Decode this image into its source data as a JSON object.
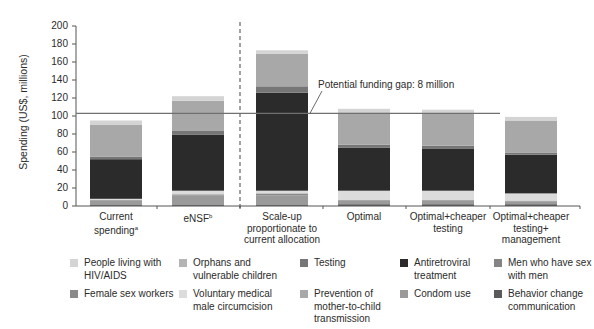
{
  "chart_data": {
    "type": "bar",
    "stacked": true,
    "title": "",
    "xlabel": "",
    "ylabel": "Spending (US$, millions)",
    "ylim": [
      0,
      200
    ],
    "yticks": [
      0,
      20,
      40,
      60,
      80,
      100,
      120,
      140,
      160,
      180,
      200
    ],
    "grid": false,
    "legend_position": "bottom",
    "categories": [
      "Current spending",
      "eNSF",
      "Scale-up proportionate to current allocation",
      "Optimal",
      "Optimal+cheaper testing",
      "Optimal+cheaper testing+ management"
    ],
    "category_superscripts": [
      "a",
      "b",
      "",
      "",
      "",
      ""
    ],
    "series": [
      {
        "name": "Behavior change communication",
        "color": "#5a5a5a",
        "values": [
          1,
          1,
          1,
          2,
          2,
          2
        ]
      },
      {
        "name": "Condom use",
        "color": "#9a9a9a",
        "values": [
          5,
          11,
          11,
          4,
          4,
          3
        ]
      },
      {
        "name": "Female sex workers",
        "color": "#8a8a8a",
        "values": [
          1,
          1,
          2,
          1,
          1,
          1
        ]
      },
      {
        "name": "Voluntary medical male circumcision",
        "color": "#dcdcdc",
        "values": [
          1,
          4,
          3,
          10,
          10,
          8
        ]
      },
      {
        "name": "Antiretroviral treatment",
        "color": "#2b2b2b",
        "values": [
          44,
          62,
          109,
          48,
          47,
          43
        ]
      },
      {
        "name": "Testing",
        "color": "#767676",
        "values": [
          3,
          5,
          7,
          3,
          3,
          2
        ]
      },
      {
        "name": "Prevention of mother-to-child transmission",
        "color": "#a8a8a8",
        "values": [
          35,
          33,
          36,
          36,
          36,
          36
        ]
      },
      {
        "name": "People living with HIV/AIDS",
        "color": "#d4d4d4",
        "values": [
          5,
          5,
          4,
          4,
          4,
          4
        ]
      },
      {
        "name": "Men who have sex with men",
        "color": "#848484",
        "values": [
          0,
          0,
          0,
          0,
          0,
          0
        ]
      },
      {
        "name": "Orphans and vulnerable children",
        "color": "#b4b4b4",
        "values": [
          0,
          0,
          0,
          0,
          0,
          0
        ]
      }
    ],
    "totals_approx": [
      95,
      122,
      173,
      108,
      107,
      99
    ],
    "reference_line": {
      "value": 103,
      "label": "Potential funding gap: 8 million"
    },
    "divider_after_category_index": 1
  },
  "axis": {
    "ylabel": "Spending (US$, millions)",
    "ticks": [
      "0",
      "20",
      "40",
      "60",
      "80",
      "100",
      "120",
      "140",
      "160",
      "180",
      "200"
    ]
  },
  "xlabels": [
    {
      "lines": [
        "Current",
        "spending"
      ],
      "sup": "a"
    },
    {
      "lines": [
        "eNSF"
      ],
      "sup": "b"
    },
    {
      "lines": [
        "Scale-up",
        "proportionate to",
        "current allocation"
      ],
      "sup": ""
    },
    {
      "lines": [
        "Optimal"
      ],
      "sup": ""
    },
    {
      "lines": [
        "Optimal+cheaper",
        "testing"
      ],
      "sup": ""
    },
    {
      "lines": [
        "Optimal+cheaper",
        "testing+",
        "management"
      ],
      "sup": ""
    }
  ],
  "annotation": "Potential funding gap: 8 million",
  "legend": [
    {
      "label": "People living with HIV/AIDS",
      "color": "#d4d4d4"
    },
    {
      "label": "Orphans and vulnerable children",
      "color": "#b4b4b4"
    },
    {
      "label": "Testing",
      "color": "#767676"
    },
    {
      "label": "Antiretroviral treatment",
      "color": "#2b2b2b"
    },
    {
      "label": "Men who have sex with men",
      "color": "#848484"
    },
    {
      "label": "Female sex workers",
      "color": "#8a8a8a"
    },
    {
      "label": "Voluntary medical male circumcision",
      "color": "#dcdcdc"
    },
    {
      "label": "Prevention of mother-to-child transmission",
      "color": "#a8a8a8"
    },
    {
      "label": "Condom use",
      "color": "#9a9a9a"
    },
    {
      "label": "Behavior change communication",
      "color": "#5a5a5a"
    }
  ]
}
